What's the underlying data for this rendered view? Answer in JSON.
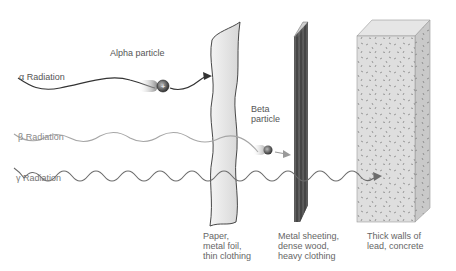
{
  "diagram": {
    "type": "radiation-penetration",
    "radiations": [
      {
        "symbol": "α",
        "label": "α Radiation",
        "particle_label": "Alpha particle",
        "stopped_by": "paper"
      },
      {
        "symbol": "β",
        "label": "β Radiation",
        "particle_label": "Beta particle",
        "stopped_by": "metal"
      },
      {
        "symbol": "γ",
        "label": "γ Radiation",
        "stopped_by": "concrete"
      }
    ],
    "labels": {
      "alpha_radiation": "α Radiation",
      "beta_radiation": "β Radiation",
      "gamma_radiation": "γ Radiation",
      "alpha_particle": "Alpha particle",
      "beta_particle": "Beta\nparticle",
      "alpha_charge": "+"
    },
    "barriers": [
      {
        "id": "paper",
        "caption": "Paper,\nmetal foil,\nthin clothing"
      },
      {
        "id": "metal",
        "caption": "Metal sheeting,\ndense wood,\nheavy clothing"
      },
      {
        "id": "concrete",
        "caption": "Thick walls of\nlead, concrete"
      }
    ],
    "colors": {
      "alpha_wave": "#333333",
      "beta_wave": "#a0a0a0",
      "gamma_wave": "#6a6a6a",
      "paper": "#e8e8e8",
      "metal": "#4a4a4a",
      "concrete_front": "#dcdcdc",
      "concrete_side": "#c8c8c8"
    }
  }
}
